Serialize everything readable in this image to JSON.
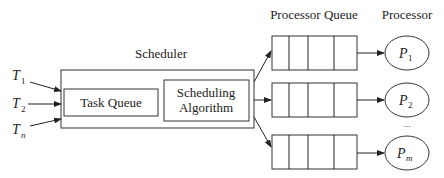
{
  "diagram": {
    "scheduler": {
      "title": "Scheduler",
      "task_queue_label": "Task Queue",
      "algorithm_label_line1": "Scheduling",
      "algorithm_label_line2": "Algorithm"
    },
    "tasks": [
      {
        "symbol": "T",
        "subscript": "1",
        "italic_sub": false
      },
      {
        "symbol": "T",
        "subscript": "2",
        "italic_sub": false
      },
      {
        "symbol": "T",
        "subscript": "n",
        "italic_sub": true
      }
    ],
    "processor_queue_header": "Processor Queue",
    "processor_header": "Processor",
    "processors": [
      {
        "symbol": "P",
        "subscript": "1",
        "italic_sub": false
      },
      {
        "symbol": "P",
        "subscript": "2",
        "italic_sub": false
      },
      {
        "symbol": "P",
        "subscript": "m",
        "italic_sub": true
      }
    ],
    "ellipsis": "..."
  }
}
